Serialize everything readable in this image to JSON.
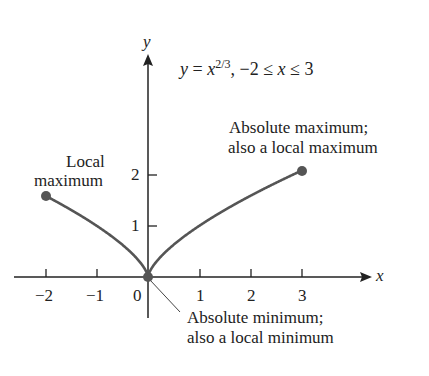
{
  "figure": {
    "equation": "y = x^{2/3},  −2 ≤ x ≤ 3",
    "equation_parts": {
      "lhs": "y",
      "eq": " = ",
      "base": "x",
      "exp": "2/3",
      "domain": ",  −2 ≤ ",
      "var": "x",
      "domain_end": " ≤ 3"
    },
    "x_axis_label": "x",
    "y_axis_label": "y",
    "x_ticks": [
      "−2",
      "−1",
      "0",
      "1",
      "2",
      "3"
    ],
    "y_ticks": [
      "1",
      "2"
    ],
    "annotations": {
      "local_max_line1": "Local",
      "local_max_line2": "maximum",
      "abs_max_line1": "Absolute maximum;",
      "abs_max_line2": "also a local maximum",
      "abs_min_line1": "Absolute minimum;",
      "abs_min_line2": "also a local minimum"
    },
    "colors": {
      "curve": "#555555",
      "axis": "#222222",
      "point": "#555555"
    }
  },
  "chart_data": {
    "type": "line",
    "xlabel": "x",
    "ylabel": "y",
    "xlim": [
      -2,
      3
    ],
    "ylim": [
      0,
      2.08
    ],
    "x_ticks": [
      -2,
      -1,
      0,
      1,
      2,
      3
    ],
    "y_ticks": [
      1,
      2
    ],
    "grid": false,
    "series": [
      {
        "name": "y = x^(2/3)",
        "x": [
          -2,
          -1.5,
          -1,
          -0.5,
          -0.1,
          0,
          0.1,
          0.5,
          1,
          1.5,
          2,
          2.5,
          3
        ],
        "y": [
          1.587,
          1.31,
          1.0,
          0.63,
          0.215,
          0,
          0.215,
          0.63,
          1.0,
          1.31,
          1.587,
          1.842,
          2.08
        ]
      }
    ],
    "points": [
      {
        "x": -2,
        "y": 1.587,
        "label": "Local maximum"
      },
      {
        "x": 0,
        "y": 0,
        "label": "Absolute minimum; also a local minimum"
      },
      {
        "x": 3,
        "y": 2.08,
        "label": "Absolute maximum; also a local maximum"
      }
    ]
  }
}
